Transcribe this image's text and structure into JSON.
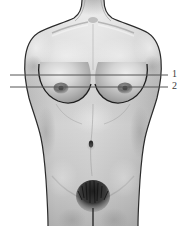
{
  "figure": {
    "view": "anterior (frontal) view",
    "rendering": "grayscale shaded anatomical illustration",
    "background_color": "#ffffff",
    "skin_tone_base": "#b9b9b9",
    "skin_tone_highlight": "#e4e4e4",
    "skin_tone_shadow": "#8d8d8d",
    "outline_color": "#2b2b2b",
    "reference_line_color": "#555555",
    "label_color": "#3a3a3a"
  },
  "reference_lines": [
    {
      "label": "1",
      "name": "upper-reference-line",
      "description": "upper horizontal reference level, above nipple",
      "y": 75,
      "x_start": 10,
      "x_end": 168
    },
    {
      "label": "2",
      "name": "lower-reference-line",
      "description": "lower horizontal reference level, at nipple level",
      "y": 87,
      "x_start": 10,
      "x_end": 168
    }
  ],
  "anatomy_landmarks": [
    {
      "name": "neck",
      "cx": 93,
      "cy": 8
    },
    {
      "name": "clavicle-left",
      "cx": 66,
      "cy": 24
    },
    {
      "name": "clavicle-right",
      "cx": 120,
      "cy": 24
    },
    {
      "name": "shoulder-left",
      "cx": 30,
      "cy": 40
    },
    {
      "name": "shoulder-right",
      "cx": 156,
      "cy": 40
    },
    {
      "name": "sternum",
      "cx": 93,
      "cy": 62
    },
    {
      "name": "breast-left",
      "cx": 64,
      "cy": 88
    },
    {
      "name": "breast-right",
      "cx": 122,
      "cy": 88
    },
    {
      "name": "nipple-left",
      "cx": 61,
      "cy": 88
    },
    {
      "name": "nipple-right",
      "cx": 125,
      "cy": 88
    },
    {
      "name": "navel",
      "cx": 91,
      "cy": 144
    },
    {
      "name": "waist",
      "cx": 93,
      "cy": 130
    },
    {
      "name": "pubic-region",
      "cx": 93,
      "cy": 196
    }
  ]
}
